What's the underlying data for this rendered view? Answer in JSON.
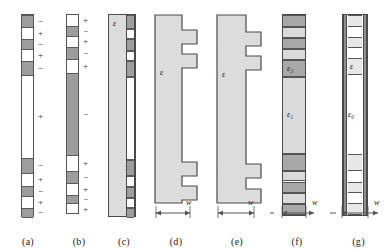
{
  "figure": {
    "type": "technical-diagram",
    "background": "#ffffff",
    "colors": {
      "dark_gray": "#9d9d9d",
      "mid_gray": "#a8a8a8",
      "light_gray": "#dadada",
      "slab_gray": "#dcdcdc",
      "outline": "#4a4a4a",
      "text": "#1a1a1a"
    }
  },
  "panels": [
    {
      "id": "a",
      "caption": "(a)",
      "kind": "poled-stripe-bar",
      "segments": [
        {
          "fill": "dark",
          "height": 13,
          "sign": "−"
        },
        {
          "fill": "light",
          "height": 11,
          "sign": "+"
        },
        {
          "fill": "dark",
          "height": 11,
          "sign": "−"
        },
        {
          "fill": "light",
          "height": 11,
          "sign": "+"
        },
        {
          "fill": "dark",
          "height": 15,
          "sign": "−"
        },
        {
          "fill": "light",
          "height": 82,
          "sign": "+"
        },
        {
          "fill": "dark",
          "height": 16,
          "sign": "−"
        },
        {
          "fill": "light",
          "height": 12,
          "sign": "+"
        },
        {
          "fill": "dark",
          "height": 11,
          "sign": "−"
        },
        {
          "fill": "light",
          "height": 11,
          "sign": "+"
        },
        {
          "fill": "dark",
          "height": 10,
          "sign": "−"
        }
      ]
    },
    {
      "id": "b",
      "caption": "(b)",
      "kind": "poled-stripe-bar",
      "segments": [
        {
          "fill": "light",
          "height": 11,
          "sign": "+"
        },
        {
          "fill": "dark",
          "height": 11,
          "sign": "−"
        },
        {
          "fill": "light",
          "height": 10,
          "sign": "+"
        },
        {
          "fill": "dark",
          "height": 13,
          "sign": "−"
        },
        {
          "fill": "light",
          "height": 13,
          "sign": "+"
        },
        {
          "fill": "dark",
          "height": 83,
          "sign": "−"
        },
        {
          "fill": "light",
          "height": 15,
          "sign": "+"
        },
        {
          "fill": "dark",
          "height": 13,
          "sign": "−"
        },
        {
          "fill": "light",
          "height": 11,
          "sign": "+"
        },
        {
          "fill": "dark",
          "height": 9,
          "sign": "−"
        },
        {
          "fill": "light",
          "height": 11,
          "sign": "+"
        }
      ]
    },
    {
      "id": "c",
      "caption": "(c)",
      "kind": "slab-with-edge-grating",
      "label": "ε",
      "edge_segments": [
        {
          "fill": "dark",
          "height": 14
        },
        {
          "fill": "light",
          "height": 10
        },
        {
          "fill": "dark",
          "height": 12
        },
        {
          "fill": "light",
          "height": 10
        },
        {
          "fill": "dark",
          "height": 16
        },
        {
          "fill": "light",
          "height": 82
        },
        {
          "fill": "dark",
          "height": 16
        },
        {
          "fill": "light",
          "height": 11
        },
        {
          "fill": "dark",
          "height": 11
        },
        {
          "fill": "light",
          "height": 10
        },
        {
          "fill": "dark",
          "height": 10
        }
      ]
    },
    {
      "id": "d",
      "caption": "(d)",
      "kind": "castellated-comb",
      "label": "ε",
      "dimension": "w",
      "teeth": [
        {
          "top": 16,
          "height": 14
        },
        {
          "top": 40,
          "height": 14
        },
        {
          "top": 148,
          "height": 14
        },
        {
          "top": 172,
          "height": 14
        }
      ]
    },
    {
      "id": "e",
      "caption": "(e)",
      "kind": "castellated-comb",
      "label": "ε",
      "dimension": "w",
      "teeth": [
        {
          "top": 18,
          "height": 14
        },
        {
          "top": 42,
          "height": 14
        },
        {
          "top": 150,
          "height": 14
        },
        {
          "top": 175,
          "height": 14
        }
      ]
    },
    {
      "id": "f",
      "caption": "(f)",
      "kind": "layered-stack",
      "dimension": "w",
      "labels": [
        {
          "text": "ε",
          "sub": "2"
        },
        {
          "text": "ε",
          "sub": "1"
        }
      ],
      "bands": [
        {
          "fill": "g1",
          "height": 13
        },
        {
          "fill": "g2",
          "height": 11
        },
        {
          "fill": "g1",
          "height": 12
        },
        {
          "fill": "g2",
          "height": 11
        },
        {
          "fill": "g1",
          "height": 18,
          "label": "ε₂"
        },
        {
          "fill": "g2",
          "height": 80,
          "label": "ε₁"
        },
        {
          "fill": "g1",
          "height": 18
        },
        {
          "fill": "g2",
          "height": 11
        },
        {
          "fill": "g1",
          "height": 12
        },
        {
          "fill": "g2",
          "height": 11
        },
        {
          "fill": "g1",
          "height": 12
        }
      ]
    },
    {
      "id": "g",
      "caption": "(g)",
      "kind": "railed-layered-stack",
      "dimension": "w",
      "labels": [
        {
          "text": "ε",
          "sub": ""
        },
        {
          "text": "ε",
          "sub": "0"
        }
      ],
      "bands": [
        {
          "fill": "g3",
          "height": 12
        },
        {
          "fill": "white",
          "height": 10
        },
        {
          "fill": "g3",
          "height": 12
        },
        {
          "fill": "white",
          "height": 10
        },
        {
          "fill": "g3",
          "height": 17,
          "label": "ε"
        },
        {
          "fill": "white",
          "height": 80,
          "label": "ε₀"
        },
        {
          "fill": "g3",
          "height": 17
        },
        {
          "fill": "white",
          "height": 11
        },
        {
          "fill": "g3",
          "height": 12
        },
        {
          "fill": "white",
          "height": 10
        },
        {
          "fill": "g3",
          "height": 12
        }
      ]
    }
  ],
  "dimension_label": "w"
}
